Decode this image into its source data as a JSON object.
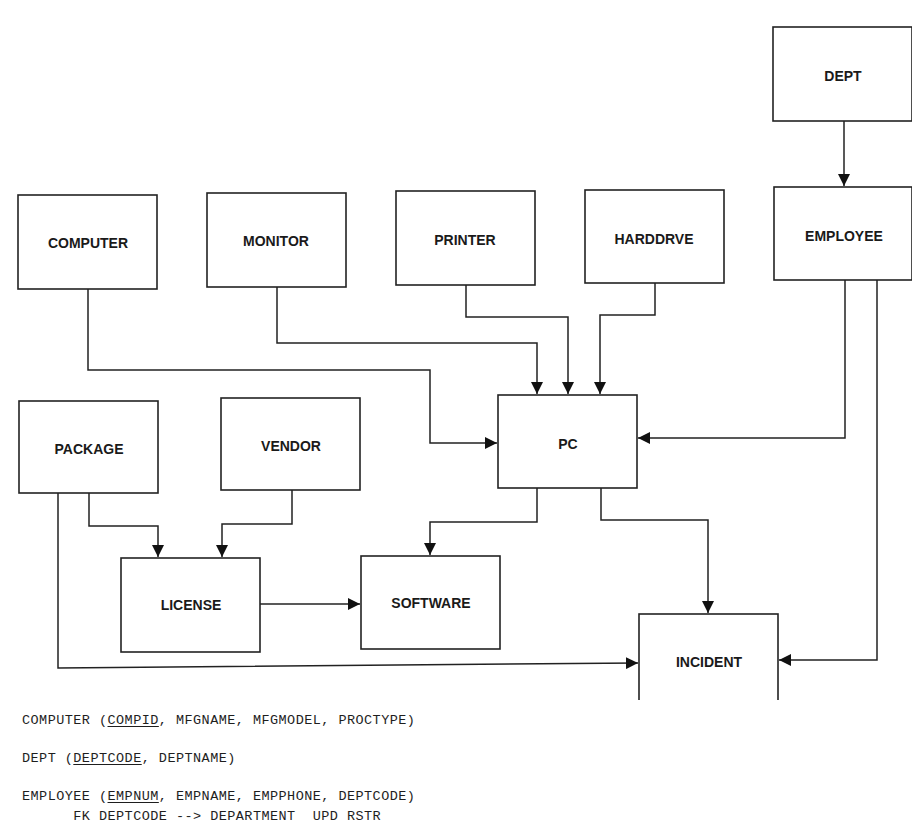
{
  "entities": {
    "dept": "DEPT",
    "computer": "COMPUTER",
    "monitor": "MONITOR",
    "printer": "PRINTER",
    "harddrve": "HARDDRVE",
    "employee": "EMPLOYEE",
    "package": "PACKAGE",
    "vendor": "VENDOR",
    "pc": "PC",
    "license": "LICENSE",
    "software": "SOFTWARE",
    "incident": "INCIDENT"
  },
  "relationships": [
    {
      "from": "DEPT",
      "to": "EMPLOYEE"
    },
    {
      "from": "COMPUTER",
      "to": "PC"
    },
    {
      "from": "MONITOR",
      "to": "PC"
    },
    {
      "from": "PRINTER",
      "to": "PC"
    },
    {
      "from": "HARDDRVE",
      "to": "PC"
    },
    {
      "from": "EMPLOYEE",
      "to": "PC"
    },
    {
      "from": "EMPLOYEE",
      "to": "INCIDENT"
    },
    {
      "from": "PACKAGE",
      "to": "LICENSE"
    },
    {
      "from": "VENDOR",
      "to": "LICENSE"
    },
    {
      "from": "PACKAGE",
      "to": "INCIDENT"
    },
    {
      "from": "LICENSE",
      "to": "SOFTWARE"
    },
    {
      "from": "PC",
      "to": "SOFTWARE"
    },
    {
      "from": "PC",
      "to": "INCIDENT"
    }
  ],
  "schema": {
    "computer": {
      "name": "COMPUTER (",
      "pk": "COMPID",
      "rest": ", MFGNAME, MFGMODEL, PROCTYPE)"
    },
    "dept": {
      "name": "DEPT (",
      "pk": "DEPTCODE",
      "rest": ", DEPTNAME)"
    },
    "employee": {
      "name": "EMPLOYEE (",
      "pk": "EMPNUM",
      "rest": ", EMPNAME, EMPPHONE, DEPTCODE)",
      "fk": "      FK DEPTCODE --> DEPARTMENT  UPD RSTR"
    }
  }
}
